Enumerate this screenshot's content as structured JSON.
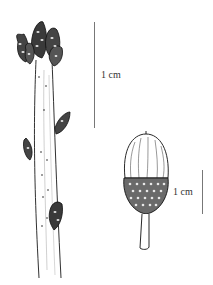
{
  "figure": {
    "subjects": [
      "twig-with-buds",
      "acorn"
    ],
    "scale_bars": [
      {
        "id": "twig-scale",
        "label": "1 cm"
      },
      {
        "id": "acorn-scale",
        "label": "1 cm"
      }
    ],
    "colors": {
      "ink": "#1a1a1a",
      "scale_bar": "#777777",
      "background": "#ffffff"
    }
  }
}
